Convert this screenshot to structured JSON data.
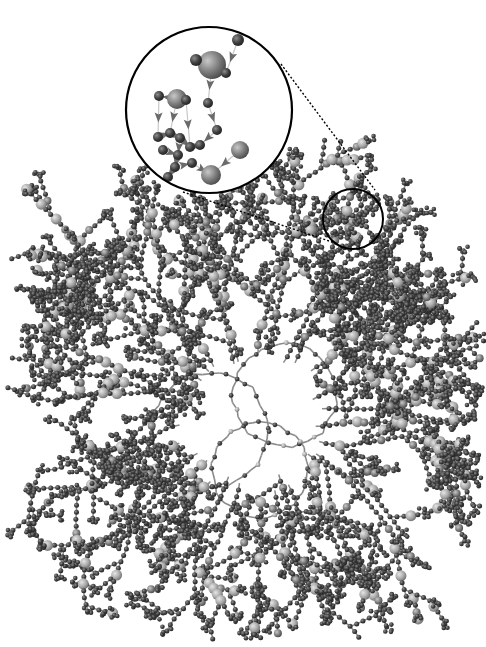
{
  "figure": {
    "type": "network-graph",
    "colors": {
      "background": "#ffffff",
      "edge": "#8a8a8a",
      "node_dark": "#3c3c3c",
      "node_mid": "#707070",
      "node_light": "#b4b4b4",
      "callout_line": "#000000"
    },
    "core": {
      "center": [
        255,
        420
      ],
      "rings": [
        {
          "cx": 210,
          "cy": 430,
          "r": 58
        },
        {
          "cx": 285,
          "cy": 395,
          "r": 52
        },
        {
          "cx": 260,
          "cy": 470,
          "r": 48
        }
      ],
      "branch_count": 34,
      "seed": 7
    },
    "zoom_source": {
      "cx": 353,
      "cy": 219,
      "r": 30
    },
    "zoom_inset": {
      "cx": 209,
      "cy": 110,
      "r": 83
    },
    "inset_nodes": [
      {
        "x": 238,
        "y": 40,
        "r": 6,
        "tone": "dark"
      },
      {
        "x": 212,
        "y": 65,
        "r": 14,
        "tone": "mid"
      },
      {
        "x": 196,
        "y": 60,
        "r": 6,
        "tone": "dark"
      },
      {
        "x": 226,
        "y": 73,
        "r": 5,
        "tone": "dark"
      },
      {
        "x": 208,
        "y": 103,
        "r": 5,
        "tone": "dark"
      },
      {
        "x": 177,
        "y": 99,
        "r": 10,
        "tone": "mid"
      },
      {
        "x": 159,
        "y": 96,
        "r": 5,
        "tone": "dark"
      },
      {
        "x": 186,
        "y": 100,
        "r": 5,
        "tone": "dark"
      },
      {
        "x": 217,
        "y": 130,
        "r": 5,
        "tone": "dark"
      },
      {
        "x": 158,
        "y": 137,
        "r": 5,
        "tone": "dark"
      },
      {
        "x": 170,
        "y": 133,
        "r": 5,
        "tone": "dark"
      },
      {
        "x": 180,
        "y": 138,
        "r": 5,
        "tone": "dark"
      },
      {
        "x": 163,
        "y": 150,
        "r": 5,
        "tone": "dark"
      },
      {
        "x": 178,
        "y": 155,
        "r": 5,
        "tone": "dark"
      },
      {
        "x": 190,
        "y": 147,
        "r": 5,
        "tone": "dark"
      },
      {
        "x": 200,
        "y": 145,
        "r": 5,
        "tone": "dark"
      },
      {
        "x": 175,
        "y": 167,
        "r": 5,
        "tone": "dark"
      },
      {
        "x": 192,
        "y": 163,
        "r": 5,
        "tone": "dark"
      },
      {
        "x": 168,
        "y": 177,
        "r": 5,
        "tone": "dark"
      },
      {
        "x": 240,
        "y": 150,
        "r": 9,
        "tone": "mid"
      },
      {
        "x": 211,
        "y": 175,
        "r": 10,
        "tone": "mid"
      }
    ],
    "inset_edges": [
      [
        0,
        3
      ],
      [
        1,
        2
      ],
      [
        1,
        3
      ],
      [
        1,
        4
      ],
      [
        4,
        8
      ],
      [
        5,
        6
      ],
      [
        5,
        7
      ],
      [
        5,
        10
      ],
      [
        8,
        15
      ],
      [
        7,
        14
      ],
      [
        9,
        10
      ],
      [
        10,
        11
      ],
      [
        11,
        13
      ],
      [
        12,
        13
      ],
      [
        13,
        16
      ],
      [
        14,
        15
      ],
      [
        16,
        17
      ],
      [
        16,
        18
      ],
      [
        17,
        20
      ],
      [
        19,
        20
      ],
      [
        6,
        9
      ],
      [
        11,
        14
      ]
    ],
    "chart_data": null
  }
}
